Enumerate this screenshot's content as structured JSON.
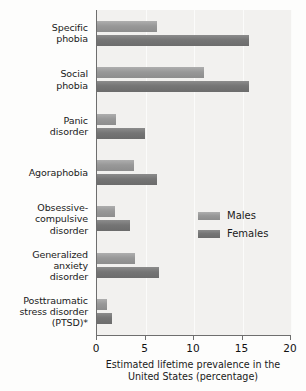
{
  "chart_data": {
    "type": "bar",
    "orientation": "horizontal",
    "title": "",
    "xlabel": "Estimated lifetime prevalence in the United States (percentage)",
    "ylabel": "",
    "xlim": [
      0,
      20
    ],
    "xticks": [
      0,
      5,
      10,
      15,
      20
    ],
    "xtick_labels": [
      "0",
      "5",
      "10",
      "15",
      "20"
    ],
    "grid": false,
    "legend_position": "middle-right",
    "categories": [
      "Specific phobia",
      "Social phobia",
      "Panic disorder",
      "Agoraphobia",
      "Obsessive-compulsive disorder",
      "Generalized anxiety disorder",
      "Posttraumatic stress disorder (PTSD)*"
    ],
    "category_label_lines": [
      [
        "Specific",
        "phobia"
      ],
      [
        "Social",
        "phobia"
      ],
      [
        "Panic",
        "disorder"
      ],
      [
        "Agoraphobia"
      ],
      [
        "Obsessive-",
        "compulsive",
        "disorder"
      ],
      [
        "Generalized",
        "anxiety",
        "disorder"
      ],
      [
        "Posttraumatic",
        "stress disorder",
        "(PTSD)*"
      ]
    ],
    "series": [
      {
        "name": "Males",
        "color": "#989898",
        "values": [
          6.2,
          11.0,
          2.0,
          3.8,
          1.9,
          3.9,
          1.0
        ]
      },
      {
        "name": "Females",
        "color": "#757575",
        "values": [
          15.7,
          15.7,
          4.9,
          6.2,
          3.4,
          6.4,
          1.5
        ]
      }
    ]
  },
  "axis": {
    "x_title_line1": "Estimated lifetime prevalence in the",
    "x_title_line2": "United States (percentage)"
  },
  "legend": {
    "items": [
      {
        "label": "Males"
      },
      {
        "label": "Females"
      }
    ]
  },
  "colors": {
    "males": "#989898",
    "females": "#757575",
    "plot_background": "#f2f1ef",
    "page_background": "#fdfdfc",
    "axis": "#6e6e6e",
    "text": "#1a1a1a"
  }
}
